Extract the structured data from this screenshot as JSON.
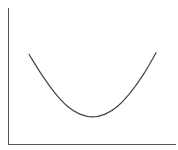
{
  "chart_data": {
    "type": "line",
    "title": "",
    "xlabel": "",
    "ylabel": "",
    "grid": false,
    "legend": null,
    "x": [
      0,
      0.1,
      0.2,
      0.3,
      0.4,
      0.5,
      0.6,
      0.7,
      0.8,
      0.9,
      1.0
    ],
    "series": [
      {
        "name": "curve",
        "values": [
          0.66,
          0.51,
          0.38,
          0.28,
          0.22,
          0.2,
          0.22,
          0.28,
          0.38,
          0.51,
          0.67
        ]
      }
    ],
    "xlim": [
      -0.15,
      1.1
    ],
    "ylim": [
      0,
      1
    ]
  },
  "style": {
    "axis_color": "#555555",
    "line_color": "#444444",
    "background": "#ffffff"
  }
}
